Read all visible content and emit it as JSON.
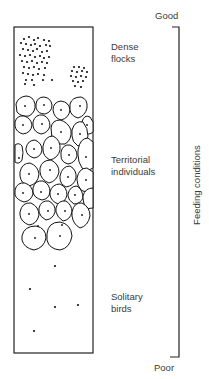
{
  "scale": {
    "top_label": "Good",
    "bottom_label": "Poor",
    "axis_label": "Feeding conditions"
  },
  "zones": [
    {
      "id": "dense",
      "line1": "Dense",
      "line2": "flocks"
    },
    {
      "id": "territorial",
      "line1": "Territorial",
      "line2": "individuals"
    },
    {
      "id": "solitary",
      "line1": "Solitary",
      "line2": "birds"
    }
  ],
  "colors": {
    "line": "#222222",
    "text": "#3a3a3a",
    "background": "#ffffff"
  }
}
